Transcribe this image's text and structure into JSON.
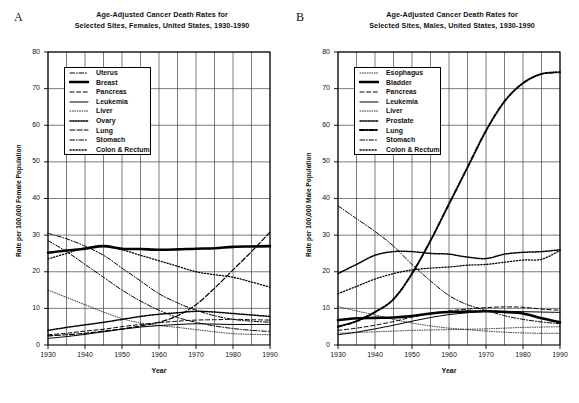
{
  "figure": {
    "panels": [
      {
        "letter": "A",
        "title_line1": "Age-Adjusted Cancer Death Rates for",
        "title_line2": "Selected Sites, Females, United States, 1930-1990",
        "ylabel": "Rate per 100,000 Female Population",
        "xlabel": "Year"
      },
      {
        "letter": "B",
        "title_line1": "Age-Adjusted Cancer Death Rates for",
        "title_line2": "Selected Sites, Males, United States, 1930-1990",
        "ylabel": "Rate per 100,000 Male Population",
        "xlabel": "Year"
      }
    ]
  },
  "chart_data": [
    {
      "type": "line",
      "panel": "A",
      "title": "Age-Adjusted Cancer Death Rates for Selected Sites, Females, United States, 1930-1990",
      "xlabel": "Year",
      "ylabel": "Rate per 100,000 Female Population",
      "xlim": [
        1930,
        1990
      ],
      "ylim": [
        0,
        80
      ],
      "yticks": [
        0,
        10,
        20,
        30,
        40,
        50,
        60,
        70,
        80
      ],
      "xticks": [
        1930,
        1940,
        1950,
        1960,
        1970,
        1980,
        1990
      ],
      "grid": true,
      "legend_position": "upper-left-inside",
      "x": [
        1930,
        1935,
        1940,
        1945,
        1950,
        1955,
        1960,
        1965,
        1970,
        1975,
        1980,
        1985,
        1990
      ],
      "series": [
        {
          "name": "Uterus",
          "style": "dash-dot",
          "width": 1,
          "values": [
            30.5,
            29.0,
            27.0,
            24.5,
            21.0,
            17.5,
            14.0,
            11.5,
            9.5,
            8.0,
            7.0,
            6.5,
            6.2
          ]
        },
        {
          "name": "Breast",
          "style": "solid-thick",
          "width": 2.6,
          "values": [
            25.2,
            25.8,
            26.3,
            27.0,
            26.3,
            26.2,
            26.0,
            26.1,
            26.3,
            26.4,
            26.8,
            26.9,
            27.0
          ]
        },
        {
          "name": "Pancreas",
          "style": "dashed",
          "width": 1,
          "values": [
            2.8,
            3.2,
            3.8,
            4.3,
            5.0,
            5.6,
            6.1,
            6.5,
            6.8,
            6.9,
            7.0,
            6.9,
            6.8
          ]
        },
        {
          "name": "Leukemia",
          "style": "solid-thin",
          "width": 1,
          "values": [
            1.8,
            2.3,
            2.9,
            3.6,
            4.3,
            4.9,
            5.3,
            5.6,
            5.8,
            5.7,
            5.6,
            5.6,
            5.6
          ]
        },
        {
          "name": "Liver",
          "style": "dotted-fine",
          "width": 0.8,
          "values": [
            15.0,
            13.0,
            11.0,
            9.0,
            7.2,
            6.0,
            5.3,
            4.8,
            4.2,
            3.6,
            3.1,
            2.9,
            2.8
          ]
        },
        {
          "name": "Ovary",
          "style": "dotted-heavy",
          "width": 1.5,
          "values": [
            4.0,
            4.8,
            5.5,
            6.2,
            7.0,
            7.8,
            8.4,
            8.8,
            9.2,
            9.0,
            8.6,
            8.2,
            7.8
          ]
        },
        {
          "name": "Lung",
          "style": "solid-dashlong",
          "width": 1.2,
          "values": [
            2.5,
            2.8,
            3.2,
            3.8,
            4.4,
            5.2,
            6.2,
            8.0,
            11.0,
            15.5,
            20.5,
            25.5,
            30.8
          ]
        },
        {
          "name": "Stomach",
          "style": "dash-dot",
          "width": 1,
          "values": [
            28.5,
            25.5,
            22.0,
            18.5,
            15.0,
            12.0,
            9.5,
            7.5,
            6.2,
            5.2,
            4.5,
            4.0,
            3.7
          ]
        },
        {
          "name": "Colon & Rectum",
          "style": "dotted",
          "width": 1.3,
          "values": [
            23.5,
            25.0,
            26.5,
            27.0,
            26.0,
            24.5,
            23.0,
            21.5,
            20.0,
            19.2,
            18.5,
            17.2,
            15.8
          ]
        }
      ]
    },
    {
      "type": "line",
      "panel": "B",
      "title": "Age-Adjusted Cancer Death Rates for Selected Sites, Males, United States, 1930-1990",
      "xlabel": "Year",
      "ylabel": "Rate per 100,000 Male Population",
      "xlim": [
        1930,
        1990
      ],
      "ylim": [
        0,
        80
      ],
      "yticks": [
        0,
        10,
        20,
        30,
        40,
        50,
        60,
        70,
        80
      ],
      "xticks": [
        1930,
        1940,
        1950,
        1960,
        1970,
        1980,
        1990
      ],
      "grid": true,
      "legend_position": "upper-left-inside",
      "x": [
        1930,
        1935,
        1940,
        1945,
        1950,
        1955,
        1960,
        1965,
        1970,
        1975,
        1980,
        1985,
        1990
      ],
      "series": [
        {
          "name": "Esophagus",
          "style": "dotted-fine",
          "width": 0.8,
          "values": [
            3.2,
            3.4,
            3.6,
            3.8,
            4.0,
            4.1,
            4.2,
            4.3,
            4.4,
            4.6,
            4.8,
            4.9,
            5.0
          ]
        },
        {
          "name": "Bladder",
          "style": "solid-thick",
          "width": 2.6,
          "values": [
            6.8,
            7.3,
            7.4,
            7.5,
            7.9,
            8.6,
            9.0,
            9.1,
            9.2,
            9.0,
            8.6,
            7.3,
            6.2
          ]
        },
        {
          "name": "Pancreas",
          "style": "dashed",
          "width": 1,
          "values": [
            4.0,
            4.6,
            5.4,
            6.4,
            7.6,
            8.6,
            9.3,
            9.8,
            10.2,
            10.4,
            10.3,
            9.8,
            9.5
          ]
        },
        {
          "name": "Leukemia",
          "style": "solid-thin",
          "width": 1,
          "values": [
            2.8,
            3.5,
            4.4,
            5.4,
            6.5,
            7.5,
            8.3,
            8.8,
            9.2,
            9.2,
            9.1,
            9.0,
            8.9
          ]
        },
        {
          "name": "Liver",
          "style": "dotted-fine",
          "width": 0.8,
          "values": [
            10.5,
            9.3,
            8.2,
            7.0,
            6.0,
            5.2,
            4.6,
            4.2,
            3.8,
            3.5,
            3.3,
            3.2,
            3.2
          ]
        },
        {
          "name": "Prostate",
          "style": "dotted-heavy",
          "width": 1.5,
          "values": [
            19.5,
            22.0,
            24.5,
            25.5,
            25.5,
            25.0,
            24.8,
            24.0,
            23.6,
            24.8,
            25.3,
            25.5,
            26.0
          ]
        },
        {
          "name": "Lung",
          "style": "dash-dot-heavy",
          "width": 2,
          "values": [
            5.0,
            6.5,
            9.0,
            12.5,
            19.5,
            28.5,
            38.5,
            48.5,
            58.5,
            66.5,
            71.5,
            74.0,
            74.5
          ]
        },
        {
          "name": "Stomach",
          "style": "dash-dot",
          "width": 1,
          "values": [
            38.0,
            34.5,
            31.0,
            27.0,
            22.0,
            17.5,
            13.5,
            11.0,
            9.5,
            8.0,
            7.0,
            6.3,
            5.8
          ]
        },
        {
          "name": "Colon & Rectum",
          "style": "dotted",
          "width": 1.3,
          "values": [
            14.0,
            16.0,
            18.0,
            19.5,
            20.5,
            21.0,
            21.3,
            21.8,
            22.0,
            22.6,
            23.2,
            23.4,
            25.8
          ]
        }
      ]
    }
  ],
  "legends": [
    {
      "panel": "A",
      "items": [
        {
          "label": "Uterus",
          "style": "dash-dot"
        },
        {
          "label": "Breast",
          "style": "solid-thick"
        },
        {
          "label": "Pancreas",
          "style": "dashed"
        },
        {
          "label": "Leukemia",
          "style": "solid-thin"
        },
        {
          "label": "Liver",
          "style": "dotted-fine"
        },
        {
          "label": "Ovary",
          "style": "dotted-heavy"
        },
        {
          "label": "Lung",
          "style": "solid-dashlong"
        },
        {
          "label": "Stomach",
          "style": "dash-dot"
        },
        {
          "label": "Colon & Rectum",
          "style": "dotted"
        }
      ]
    },
    {
      "panel": "B",
      "items": [
        {
          "label": "Esophagus",
          "style": "dotted-fine"
        },
        {
          "label": "Bladder",
          "style": "solid-thick"
        },
        {
          "label": "Pancreas",
          "style": "dashed"
        },
        {
          "label": "Leukemia",
          "style": "solid-thin"
        },
        {
          "label": "Liver",
          "style": "dotted-fine"
        },
        {
          "label": "Prostate",
          "style": "dotted-heavy"
        },
        {
          "label": "Lung",
          "style": "dash-dot-heavy"
        },
        {
          "label": "Stomach",
          "style": "dash-dot"
        },
        {
          "label": "Colon & Rectum",
          "style": "dotted"
        }
      ]
    }
  ],
  "colors": {
    "ink": "#000000",
    "grid": "#444444",
    "background": "#ffffff"
  }
}
